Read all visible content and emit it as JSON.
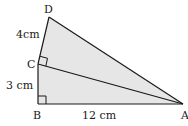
{
  "diagram": {
    "type": "geometry",
    "fill_color": "#e6e6e6",
    "stroke_color": "#1a1a1a",
    "vertices": {
      "A": {
        "label": "A",
        "x": 183,
        "y": 104
      },
      "B": {
        "label": "B",
        "x": 38,
        "y": 104
      },
      "C": {
        "label": "C",
        "x": 38,
        "y": 64
      },
      "D": {
        "label": "D",
        "x": 49,
        "y": 17
      }
    },
    "edges": [
      {
        "from": "A",
        "to": "B",
        "length_label": "12 cm"
      },
      {
        "from": "B",
        "to": "C",
        "length_label": "3 cm"
      },
      {
        "from": "C",
        "to": "D",
        "length_label": "4cm"
      },
      {
        "from": "D",
        "to": "A",
        "length_label": ""
      },
      {
        "from": "C",
        "to": "A",
        "length_label": ""
      }
    ],
    "right_angles": [
      "B",
      "C"
    ],
    "labels": {
      "D": "D",
      "C": "C",
      "B": "B",
      "A": "A",
      "cd_length": "4cm",
      "bc_length": "3 cm",
      "ab_length": "12 cm"
    }
  }
}
